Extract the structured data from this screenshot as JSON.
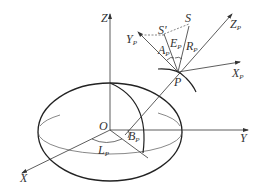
{
  "diagram": {
    "type": "geodetic coordinate system diagram",
    "colors": {
      "line": "#333333",
      "thin_line": "#555555",
      "background": "#ffffff"
    },
    "labels": {
      "origin": "O",
      "axis_z": "Z",
      "axis_y": "Y",
      "axis_x": "X",
      "point_p": "P",
      "point_s": "S",
      "point_s_prime": "S'",
      "local_z": {
        "base": "Z",
        "sub": "P"
      },
      "local_y": {
        "base": "Y",
        "sub": "P"
      },
      "local_x": {
        "base": "X",
        "sub": "P"
      },
      "azimuth": {
        "base": "A",
        "sub": "P"
      },
      "elevation": {
        "base": "E",
        "sub": "P"
      },
      "range": {
        "base": "R",
        "sub": "P"
      },
      "latitude": {
        "base": "B",
        "sub": "P"
      },
      "longitude": {
        "base": "L",
        "sub": "P"
      }
    }
  }
}
